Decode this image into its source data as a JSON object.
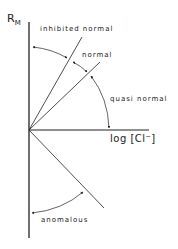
{
  "labels": {
    "y_axis": "R",
    "y_axis_sub": "M",
    "x_axis": "log [Cl⁻]",
    "inhibited_normal": "inhibited normal",
    "normal": "normal",
    "quasi_normal": "quasi normal",
    "anomalous": "anomalous"
  },
  "colors": {
    "line": "#222222",
    "background": "#ffffff"
  }
}
